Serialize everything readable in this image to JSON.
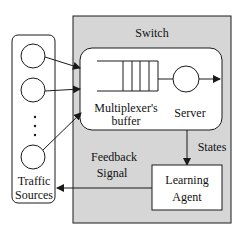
{
  "colors": {
    "switch_fill": "#d6d6d6",
    "box_fill": "#ffffff",
    "stroke": "#1a1a1a"
  },
  "switch": {
    "label": "Switch"
  },
  "multiplexer": {
    "buffer_label_line1": "Multiplexer's",
    "buffer_label_line2": "buffer",
    "server_label": "Server",
    "buffer_slots": 4
  },
  "traffic_sources": {
    "label_line1": "Traffic",
    "label_line2": "Sources",
    "source_count_shown": 3,
    "ellipsis": "..."
  },
  "learning_agent": {
    "label_line1": "Learning",
    "label_line2": "Agent"
  },
  "edges": {
    "states_label": "States",
    "feedback_label_line1": "Feedback",
    "feedback_label_line2": "Signal"
  }
}
